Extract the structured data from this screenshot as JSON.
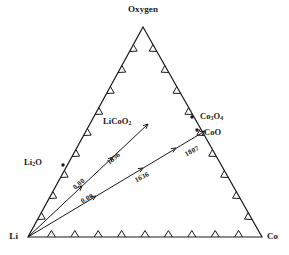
{
  "figure": {
    "type": "ternary-phase-diagram",
    "background_color": "#ffffff",
    "line_color": "#1a1a1a"
  },
  "vertices": {
    "top": {
      "label": "Oxygen",
      "x": 143,
      "y": 27
    },
    "bottom_left": {
      "label": "Li",
      "x": 28,
      "y": 237
    },
    "bottom_right": {
      "label": "Co",
      "x": 262,
      "y": 237
    }
  },
  "phase_labels": [
    {
      "name": "li2o",
      "text_html": "Li<sub>2</sub>O",
      "x": 24,
      "y": 158
    },
    {
      "name": "licoo2",
      "text_html": "LiCoO<sub>2</sub>",
      "x": 103,
      "y": 117
    },
    {
      "name": "co3o4",
      "text_html": "Co<sub>3</sub>O<sub>4</sub>",
      "x": 200,
      "y": 112
    },
    {
      "name": "coo",
      "text_html": "CoO",
      "x": 204,
      "y": 128
    }
  ],
  "numeric_labels": [
    {
      "name": "upper-ray-zero",
      "text": "0.00",
      "x": 72,
      "y": 186,
      "rotation": -40
    },
    {
      "name": "upper-ray-1636",
      "text": "1636",
      "x": 106,
      "y": 161,
      "rotation": -40
    },
    {
      "name": "lower-ray-zero",
      "text": "0.00",
      "x": 80,
      "y": 199,
      "rotation": -28
    },
    {
      "name": "lower-ray-1636",
      "text": "1636",
      "x": 134,
      "y": 178,
      "rotation": -28
    },
    {
      "name": "lower-ray-1807",
      "text": "1807",
      "x": 184,
      "y": 152,
      "rotation": -28
    }
  ],
  "rays": [
    {
      "name": "li-to-licoo2-ray",
      "from": {
        "x": 28,
        "y": 237
      },
      "to": {
        "x": 148,
        "y": 124
      },
      "markers": [
        {
          "x": 82,
          "y": 186
        },
        {
          "x": 113,
          "y": 157
        },
        {
          "x": 148,
          "y": 124
        }
      ]
    },
    {
      "name": "li-to-coo-ray",
      "from": {
        "x": 28,
        "y": 237
      },
      "to": {
        "x": 205,
        "y": 131
      },
      "markers": [
        {
          "x": 96,
          "y": 196
        },
        {
          "x": 143,
          "y": 168
        },
        {
          "x": 176,
          "y": 148
        },
        {
          "x": 205,
          "y": 131
        }
      ]
    }
  ],
  "edge_ticks": {
    "bottom_count": 9,
    "left_count": 9,
    "right_count": 9,
    "style": "chevron-inward"
  },
  "markers": [
    {
      "name": "co3o4-point",
      "x": 192,
      "y": 117
    },
    {
      "name": "coo-point",
      "x": 197,
      "y": 130
    },
    {
      "name": "li2o-point",
      "x": 63,
      "y": 165
    }
  ],
  "chart_data": {
    "type": "ternary",
    "title": "",
    "components": [
      "Li",
      "Co",
      "Oxygen"
    ],
    "phases": [
      "Li2O",
      "LiCoO2",
      "Co3O4",
      "CoO"
    ],
    "annotations": [
      "0.00",
      "1636",
      "0.00",
      "1636",
      "1807"
    ],
    "tie_lines": [
      {
        "from": "Li",
        "to": "LiCoO2",
        "temperatures": [
          "0.00",
          "1636"
        ]
      },
      {
        "from": "Li",
        "to": "CoO",
        "temperatures": [
          "0.00",
          "1636",
          "1807"
        ]
      }
    ],
    "axis_ticks": {
      "bottom": 9,
      "left": 9,
      "right": 9
    },
    "grid": false,
    "legend": "none"
  }
}
